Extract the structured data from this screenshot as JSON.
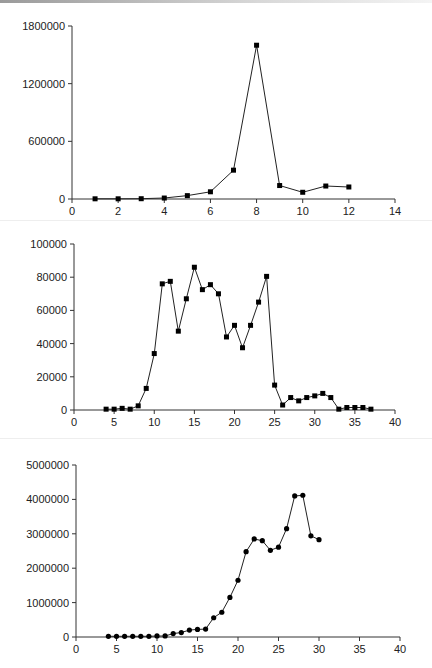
{
  "chart_data": [
    {
      "type": "line",
      "title": "",
      "xlabel": "",
      "ylabel": "",
      "xlim": [
        0,
        14
      ],
      "ylim": [
        0,
        1800000
      ],
      "xticks": [
        0,
        2,
        4,
        6,
        8,
        10,
        12,
        14
      ],
      "yticks": [
        0,
        600000,
        1200000,
        1800000
      ],
      "ytick_labels": [
        "0",
        "600000",
        "1200000",
        "1800000"
      ],
      "marker": "square",
      "grid": false,
      "legend": null,
      "x": [
        1,
        2,
        3,
        4,
        5,
        6,
        7,
        8,
        9,
        10,
        11,
        12
      ],
      "values": [
        2000,
        2000,
        3000,
        10000,
        35000,
        75000,
        300000,
        1600000,
        140000,
        70000,
        135000,
        125000
      ]
    },
    {
      "type": "line",
      "title": "",
      "xlabel": "",
      "ylabel": "",
      "xlim": [
        0,
        40
      ],
      "ylim": [
        0,
        100000
      ],
      "xticks": [
        0,
        5,
        10,
        15,
        20,
        25,
        30,
        35,
        40
      ],
      "yticks": [
        0,
        20000,
        40000,
        60000,
        80000,
        100000
      ],
      "ytick_labels": [
        "0",
        "20000",
        "40000",
        "60000",
        "80000",
        "100000"
      ],
      "marker": "square",
      "grid": false,
      "legend": null,
      "x": [
        4,
        5,
        6,
        7,
        8,
        9,
        10,
        11,
        12,
        13,
        14,
        15,
        16,
        17,
        18,
        19,
        20,
        21,
        22,
        23,
        24,
        25,
        26,
        27,
        28,
        29,
        30,
        31,
        32,
        33,
        34,
        35,
        36,
        37
      ],
      "values": [
        500,
        500,
        1000,
        500,
        2500,
        13000,
        34000,
        76000,
        77500,
        47500,
        67000,
        86000,
        72500,
        75500,
        70000,
        44000,
        51000,
        37500,
        51000,
        65000,
        80500,
        15000,
        3000,
        7500,
        5500,
        7500,
        8500,
        10000,
        7500,
        500,
        1500,
        1500,
        1500,
        500
      ]
    },
    {
      "type": "line",
      "title": "",
      "xlabel": "",
      "ylabel": "",
      "xlim": [
        0,
        40
      ],
      "ylim": [
        0,
        5000000
      ],
      "xticks": [
        0,
        5,
        10,
        15,
        20,
        25,
        30,
        35,
        40
      ],
      "yticks": [
        0,
        1000000,
        2000000,
        3000000,
        4000000,
        5000000
      ],
      "ytick_labels": [
        "0",
        "1000000",
        "2000000",
        "3000000",
        "4000000",
        "5000000"
      ],
      "marker": "circle",
      "grid": false,
      "legend": null,
      "x": [
        4,
        5,
        6,
        7,
        8,
        9,
        10,
        11,
        12,
        13,
        14,
        15,
        16,
        17,
        18,
        19,
        20,
        21,
        22,
        23,
        24,
        25,
        26,
        27,
        28,
        29,
        30
      ],
      "values": [
        20000,
        20000,
        20000,
        20000,
        20000,
        20000,
        30000,
        30000,
        100000,
        130000,
        200000,
        220000,
        230000,
        560000,
        720000,
        1150000,
        1650000,
        2480000,
        2850000,
        2800000,
        2520000,
        2610000,
        3150000,
        4100000,
        4120000,
        2940000,
        2830000
      ]
    }
  ]
}
